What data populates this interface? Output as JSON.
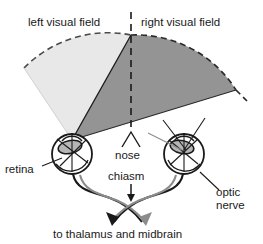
{
  "figure": {
    "title_visible": false,
    "background_color": "#ffffff",
    "labels": {
      "left_visual_field": "left visual field",
      "right_visual_field": "right visual field",
      "nose": "nose",
      "retina": "retina",
      "chiasm": "chiasm",
      "optic_nerve_line1": "optic",
      "optic_nerve_line2": "nerve",
      "destination": "to thalamus and midbrain"
    },
    "colors": {
      "left_field_fill": "#e8e8e8",
      "right_field_fill": "#949494",
      "outline": "#1a1a1a",
      "nerve_light": "#8c8c8c",
      "nerve_dark": "#1a1a1a",
      "lens_fill": "#b5b5b5",
      "eye_fill": "#ffffff"
    },
    "elements": {
      "left_field_shading": "light gray wedge, dashed arc border",
      "right_field_shading": "dark gray wedge, dashed arc border",
      "midline": "vertical dashed line from top to nose",
      "chiasm_marker": "downward arrow from chiasm label to nerve crossing",
      "nose_marker": "inverted V caret above nose label",
      "output_arrows": "two dark and two gray arrows pointing down-left and down-right"
    }
  }
}
